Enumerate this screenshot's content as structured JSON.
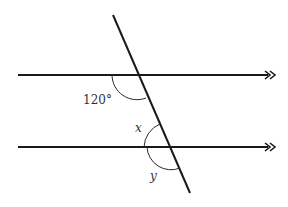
{
  "diagram": {
    "labels": {
      "given_angle": "120°",
      "angle_x": "x",
      "angle_y": "y"
    },
    "parallel_marker": "double-arrow",
    "colors": {
      "stroke": "#1a1a1a",
      "text": "#333333",
      "background": "#ffffff"
    }
  }
}
